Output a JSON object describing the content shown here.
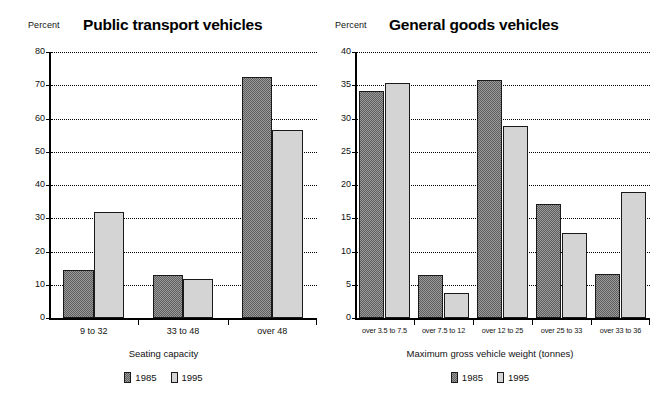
{
  "figure": {
    "background": "#ffffff",
    "series_colors": {
      "1985": "#6e6e6e",
      "1995": "#d2d2d2"
    }
  },
  "chart_data": [
    {
      "type": "bar",
      "title": "Public transport vehicles",
      "ylabel": "Percent",
      "xlabel": "Seating  capacity",
      "categories": [
        "9 to 32",
        "33 to 48",
        "over 48"
      ],
      "series": [
        {
          "name": "1985",
          "values": [
            14.5,
            12.9,
            72.6
          ]
        },
        {
          "name": "1995",
          "values": [
            32.0,
            11.6,
            56.4
          ]
        }
      ],
      "ylim": [
        0,
        80
      ],
      "yticks": [
        0,
        10,
        20,
        30,
        40,
        50,
        60,
        70,
        80
      ],
      "ytick_labels": [
        "0",
        "10",
        "20",
        "30",
        "40",
        "50",
        "60",
        "70",
        "80"
      ],
      "grid": "horizontal-dotted",
      "legend_position": "bottom-center",
      "legend": [
        "1985",
        "1995"
      ]
    },
    {
      "type": "bar",
      "title": "General goods vehicles",
      "ylabel": "Percent",
      "xlabel": "Maximum  gross  vehicle  weight  (tonnes)",
      "categories": [
        "over 3.5 to 7.5",
        "over 7.5 to 12",
        "over 12 to 25",
        "over 25 to 33",
        "over 33 to 36"
      ],
      "series": [
        {
          "name": "1985",
          "values": [
            34.1,
            6.4,
            35.8,
            17.1,
            6.6
          ]
        },
        {
          "name": "1995",
          "values": [
            35.4,
            3.8,
            28.9,
            12.8,
            18.9
          ]
        }
      ],
      "ylim": [
        0,
        40
      ],
      "yticks": [
        0,
        5,
        10,
        15,
        20,
        25,
        30,
        35,
        40
      ],
      "ytick_labels": [
        "0",
        "5",
        "10",
        "15",
        "20",
        "25",
        "30",
        "35",
        "40"
      ],
      "grid": "horizontal-dotted",
      "legend_position": "bottom-center",
      "legend": [
        "1985",
        "1995"
      ]
    }
  ]
}
